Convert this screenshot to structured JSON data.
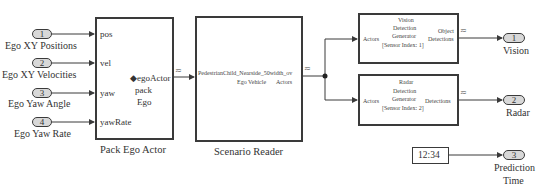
{
  "inports": [
    {
      "number": "1",
      "label": "Ego XY Positions"
    },
    {
      "number": "2",
      "label": "Ego XY Velocities"
    },
    {
      "number": "3",
      "label": "Ego Yaw Angle"
    },
    {
      "number": "4",
      "label": "Ego Yaw Rate"
    }
  ],
  "pack_ego_actor": {
    "title": "Pack Ego Actor",
    "inputs": [
      "pos",
      "vel",
      "yaw",
      "yawRate"
    ],
    "output": "egoActor",
    "center_line1": "pack",
    "center_line2": "Ego"
  },
  "scenario_reader": {
    "title": "Scenario Reader",
    "scenario_name": "PedestrianChild_Nearside_50width_ov",
    "input": "Ego Vehicle",
    "output": "Actors"
  },
  "vision_block": {
    "input": "Actors",
    "name_line1": "Vision",
    "name_line2": "Detection",
    "name_line3": "Generator",
    "sensor": "[Sensor Index: 1]",
    "output_line1": "Object",
    "output_line2": "Detections"
  },
  "radar_block": {
    "input": "Actors",
    "name_line1": "Radar",
    "name_line2": "Detection",
    "name_line3": "Generator",
    "sensor": "[Sensor Index: 2]",
    "output": "Detections"
  },
  "outports": [
    {
      "number": "1",
      "label": "Vision"
    },
    {
      "number": "2",
      "label": "Radar"
    },
    {
      "number": "3",
      "label_line1": "Prediction",
      "label_line2": "Time"
    }
  ],
  "constant_block": {
    "value": "12:34"
  },
  "bus_icon_glyph": "≂",
  "colors": {
    "line": "#3a3a3a",
    "port_fill": "#d8d8d8"
  }
}
